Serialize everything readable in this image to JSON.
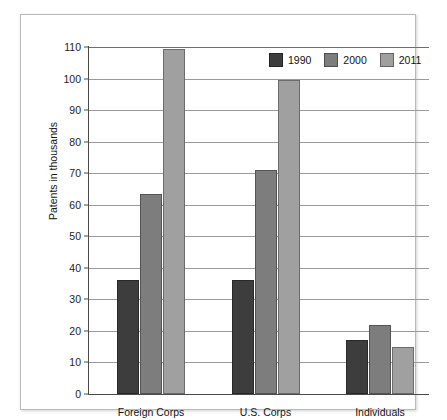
{
  "caption": {
    "clipped_header": "States of U.S. Grants"
  },
  "chart_data": {
    "type": "bar",
    "title": "",
    "xlabel": "",
    "ylabel": "Patents in thousands",
    "ylim": [
      0,
      110
    ],
    "ytick_step": 10,
    "yticks": [
      0,
      10,
      20,
      30,
      40,
      50,
      60,
      70,
      80,
      90,
      100,
      110
    ],
    "grid": true,
    "legend_position": "top-right",
    "categories": [
      "Foreign Corps",
      "U.S. Corps",
      "Individuals"
    ],
    "series": [
      {
        "name": "1990",
        "color": "#3d3d3d",
        "values": [
          36,
          36,
          17
        ]
      },
      {
        "name": "2000",
        "color": "#7d7d7d",
        "values": [
          63.5,
          71,
          22
        ]
      },
      {
        "name": "2011",
        "color": "#a0a0a0",
        "values": [
          109.5,
          99.5,
          15
        ]
      }
    ]
  }
}
